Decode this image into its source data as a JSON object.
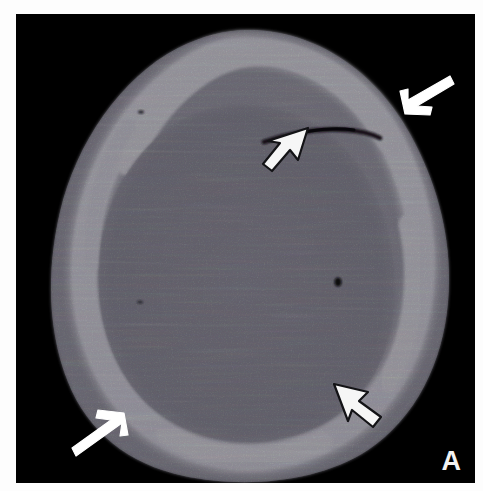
{
  "figure": {
    "panel_letter": "A",
    "modality": "ct-head-bone-window",
    "background_color": "#000000",
    "frame_color": "#fdfdfd"
  },
  "palette": {
    "background": "#000000",
    "soft_tissue": "#6d6b74",
    "soft_tissue_dark": "#55535d",
    "brain": "#4d4b56",
    "brain_inner": "#5b5964",
    "bone_bright": "#ffffff",
    "bone_mid": "#e8e8ee",
    "fracture_line": "#17161b",
    "annotation_white": "#ffffff",
    "annotation_outline_fill": "#f4f4f4",
    "annotation_outline_stroke": "#1a1a1a"
  },
  "anatomy": {
    "structures": [
      {
        "name": "scalp-soft-tissue-swelling",
        "label": "Scalp soft tissue / subgaleal hematoma",
        "shade": "gray"
      },
      {
        "name": "calvarium-bone",
        "label": "Calvarial bone (hyperdense white ring)",
        "shade": "white"
      },
      {
        "name": "intracranial-contents",
        "label": "Intracranial brain parenchyma",
        "shade": "dark-gray"
      },
      {
        "name": "linear-skull-fracture",
        "label": "Linear non-displaced skull fracture",
        "shade": "black-line"
      },
      {
        "name": "focal-hypodensity",
        "label": "Small focal hypodense focus",
        "shade": "black-dot"
      }
    ]
  },
  "annotations": [
    {
      "id": "arrow-top-right",
      "name": "solid-arrow-top-right",
      "style": "solid",
      "points_to": "scalp-soft-tissue-swelling",
      "direction": "down-left",
      "x": 390,
      "y": 88
    },
    {
      "id": "arrowhead-fracture",
      "name": "open-arrowhead-fracture",
      "style": "open",
      "points_to": "linear-skull-fracture",
      "direction": "up-right",
      "x": 258,
      "y": 130
    },
    {
      "id": "arrowhead-bottom-right",
      "name": "open-arrowhead-bottom-right",
      "style": "open",
      "points_to": "inner-table-bone",
      "direction": "up-left",
      "x": 344,
      "y": 393
    },
    {
      "id": "arrow-bottom-left",
      "name": "solid-arrow-bottom-left",
      "style": "solid",
      "points_to": "scalp-soft-tissue-swelling",
      "direction": "up-right",
      "x": 50,
      "y": 460
    }
  ]
}
